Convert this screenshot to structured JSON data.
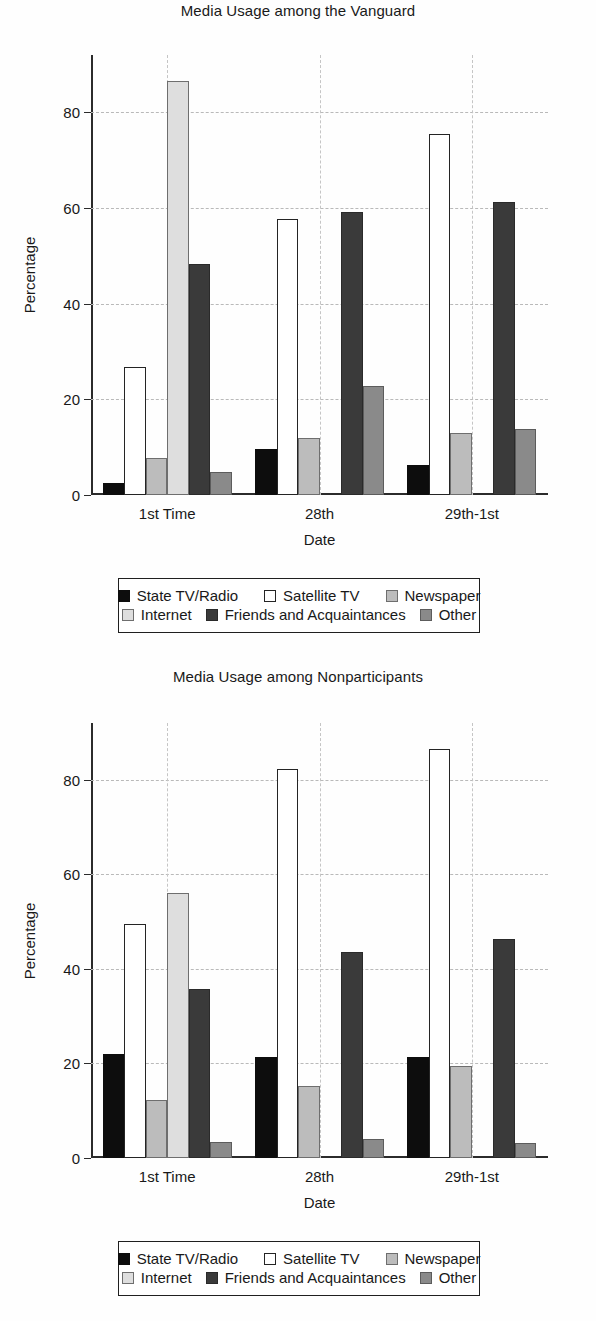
{
  "page": {
    "width": 596,
    "height": 1321,
    "background": "#ffffff"
  },
  "series_styles": {
    "State TV/Radio": "#0d0d0d",
    "Satellite TV": "#ffffff",
    "Newspaper": "#bcbcbc",
    "Internet": "#dedede",
    "Friends and Acquaintances": "#3a3a3a",
    "Other": "#8a8a8a"
  },
  "charts": [
    {
      "title": "Media Usage among the Vanguard",
      "xlabel": "Date",
      "ylabel": "Percentage"
    },
    {
      "title": "Media Usage among Nonparticipants",
      "xlabel": "Date",
      "ylabel": "Percentage"
    }
  ],
  "legend": {
    "row1": [
      {
        "label": "State TV/Radio",
        "swatch": "sw-black"
      },
      {
        "label": "Satellite TV",
        "swatch": "sw-white"
      },
      {
        "label": "Newspaper",
        "swatch": "sw-midgrey"
      }
    ],
    "row2": [
      {
        "label": "Internet",
        "swatch": "sw-lightgrey"
      },
      {
        "label": "Friends and Acquaintances",
        "swatch": "sw-darkgrey"
      },
      {
        "label": "Other",
        "swatch": "sw-grey"
      }
    ]
  },
  "chart_data": [
    {
      "type": "bar",
      "title": "Media Usage among the Vanguard",
      "xlabel": "Date",
      "ylabel": "Percentage",
      "categories": [
        "1st Time",
        "28th",
        "29th-1st"
      ],
      "yticks": [
        0,
        20,
        40,
        60,
        80
      ],
      "ylim": [
        0,
        92
      ],
      "grid": true,
      "legend_position": "below-axes",
      "series": [
        {
          "name": "State TV/Radio",
          "color": "#0d0d0d",
          "values": [
            2.5,
            9.7,
            6.2
          ]
        },
        {
          "name": "Satellite TV",
          "color": "#ffffff",
          "values": [
            26.7,
            57.8,
            75.5
          ]
        },
        {
          "name": "Newspaper",
          "color": "#bcbcbc",
          "values": [
            7.8,
            12.0,
            12.9
          ]
        },
        {
          "name": "Internet",
          "color": "#dedede",
          "values": [
            86.5,
            0,
            0
          ]
        },
        {
          "name": "Friends and Acquaintances",
          "color": "#3a3a3a",
          "values": [
            48.3,
            59.1,
            61.3
          ]
        },
        {
          "name": "Other",
          "color": "#8a8a8a",
          "values": [
            4.8,
            22.7,
            13.8
          ]
        }
      ]
    },
    {
      "type": "bar",
      "title": "Media Usage among Nonparticipants",
      "xlabel": "Date",
      "ylabel": "Percentage",
      "categories": [
        "1st Time",
        "28th",
        "29th-1st"
      ],
      "yticks": [
        0,
        20,
        40,
        60,
        80
      ],
      "ylim": [
        0,
        92
      ],
      "grid": true,
      "legend_position": "below-axes",
      "series": [
        {
          "name": "State TV/Radio",
          "color": "#0d0d0d",
          "values": [
            22.1,
            21.3,
            21.4
          ]
        },
        {
          "name": "Satellite TV",
          "color": "#ffffff",
          "values": [
            49.4,
            82.3,
            86.5
          ]
        },
        {
          "name": "Newspaper",
          "color": "#bcbcbc",
          "values": [
            12.3,
            15.2,
            19.4
          ]
        },
        {
          "name": "Internet",
          "color": "#dedede",
          "values": [
            56.1,
            0,
            0
          ]
        },
        {
          "name": "Friends and Acquaintances",
          "color": "#3a3a3a",
          "values": [
            35.8,
            43.5,
            46.4
          ]
        },
        {
          "name": "Other",
          "color": "#8a8a8a",
          "values": [
            3.4,
            4.0,
            3.1
          ]
        }
      ]
    }
  ]
}
